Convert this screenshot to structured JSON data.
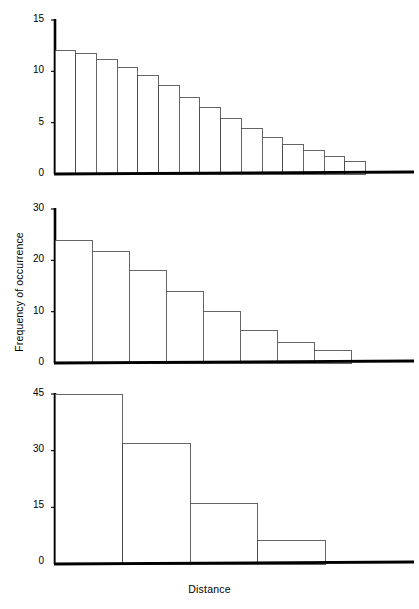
{
  "figure": {
    "xlabel": "Distance",
    "ylabel": "Frequency of occurrence",
    "axis_color": "#000000",
    "bar_edge_color": "#4a4a4a",
    "bar_fill_color": "#ffffff",
    "background_color": "#ffffff"
  },
  "chart_data": [
    {
      "type": "bar",
      "panel": "top",
      "title": "",
      "xlabel": "",
      "ylabel": "Frequency of occurrence",
      "ylim": [
        0,
        15
      ],
      "yticks": [
        0,
        5,
        10,
        15
      ],
      "ytick_labels": [
        "0",
        "5",
        "10",
        "15"
      ],
      "grid": false,
      "legend": "none",
      "bin_count": 15,
      "categories": [
        "1",
        "2",
        "3",
        "4",
        "5",
        "6",
        "7",
        "8",
        "9",
        "10",
        "11",
        "12",
        "13",
        "14",
        "15"
      ],
      "values": [
        12.0,
        11.7,
        11.2,
        10.4,
        9.6,
        8.6,
        7.5,
        6.5,
        5.4,
        4.4,
        3.6,
        2.85,
        2.25,
        1.75,
        1.25
      ]
    },
    {
      "type": "bar",
      "panel": "middle",
      "title": "",
      "xlabel": "",
      "ylabel": "Frequency of occurrence",
      "ylim": [
        0,
        30
      ],
      "yticks": [
        0,
        10,
        20,
        30
      ],
      "ytick_labels": [
        "0",
        "10",
        "20",
        "30"
      ],
      "grid": false,
      "legend": "none",
      "bin_count": 8,
      "categories": [
        "1",
        "2",
        "3",
        "4",
        "5",
        "6",
        "7",
        "8"
      ],
      "values": [
        23.8,
        21.8,
        18.1,
        14.0,
        10.0,
        6.4,
        4.0,
        2.4
      ]
    },
    {
      "type": "bar",
      "panel": "bottom",
      "title": "",
      "xlabel": "Distance",
      "ylabel": "Frequency of occurrence",
      "ylim": [
        0,
        45
      ],
      "yticks": [
        0,
        15,
        30,
        45
      ],
      "ytick_labels": [
        "0",
        "15",
        "30",
        "45"
      ],
      "grid": false,
      "legend": "none",
      "bin_count": 4,
      "categories": [
        "1",
        "2",
        "3",
        "4"
      ],
      "values": [
        45.0,
        31.8,
        16.0,
        6.3
      ]
    }
  ],
  "panels": {
    "top": {
      "ytick_labels": [
        "15",
        "10",
        "5",
        "0"
      ]
    },
    "middle": {
      "ytick_labels": [
        "30",
        "20",
        "10",
        "0"
      ]
    },
    "bottom": {
      "ytick_labels": [
        "45",
        "30",
        "15",
        "0"
      ]
    }
  }
}
